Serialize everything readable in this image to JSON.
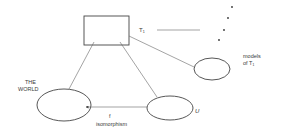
{
  "diagram": {
    "nodes": {
      "theory_box": {
        "label": "T₁",
        "shape": "rectangle"
      },
      "world": {
        "label": "THE WORLD",
        "label_lines": [
          "THE",
          "WORLD"
        ],
        "shape": "ellipse"
      },
      "model_u": {
        "label": "U",
        "shape": "ellipse"
      },
      "models_of_t": {
        "label": "models of T₁",
        "label_lines": [
          "models",
          "of T₁"
        ],
        "shape": "ellipse"
      }
    },
    "edges": [
      {
        "from": "theory_box",
        "to": "world",
        "label": ""
      },
      {
        "from": "theory_box",
        "to": "model_u",
        "label": ""
      },
      {
        "from": "theory_box",
        "to": "models_of_t",
        "label": ""
      },
      {
        "from": "model_u",
        "to": "world",
        "label": "f",
        "sublabel": "isomorphism",
        "arrow": true
      }
    ],
    "ellipsis_dots": 4,
    "stroke_color": "#444444"
  }
}
